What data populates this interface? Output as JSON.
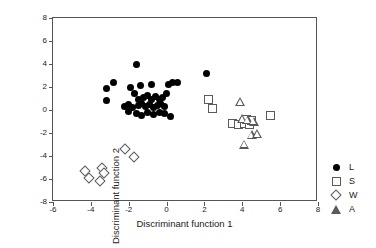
{
  "chart_data": {
    "type": "scatter",
    "title": "",
    "xlabel": "Discriminant function 1",
    "ylabel": "Discriminant function 2",
    "xlim": [
      -6,
      8
    ],
    "ylim": [
      -8,
      8
    ],
    "xticks": [
      -6,
      -4,
      -2,
      0,
      2,
      4,
      6,
      8
    ],
    "xtick_labels": [
      "-6",
      "-4",
      "-2",
      "0",
      "2",
      "4",
      "6",
      "8"
    ],
    "yticks": [
      -8,
      -6,
      -4,
      -2,
      0,
      2,
      4,
      6,
      8
    ],
    "ytick_labels": [
      "-8",
      "-6",
      "-4",
      "-2",
      "0",
      "2",
      "4",
      "6",
      "8"
    ],
    "grid": false,
    "legend_position": "right-outside",
    "series": [
      {
        "name": "L",
        "marker": "filled-circle",
        "color": "#000000",
        "points": [
          [
            -1.6,
            4.0
          ],
          [
            2.1,
            3.2
          ],
          [
            -3.2,
            1.9
          ],
          [
            -2.8,
            2.4
          ],
          [
            -1.9,
            2.0
          ],
          [
            -1.4,
            2.1
          ],
          [
            -0.8,
            2.2
          ],
          [
            0.1,
            2.2
          ],
          [
            0.3,
            2.4
          ],
          [
            0.6,
            2.4
          ],
          [
            -3.2,
            0.8
          ],
          [
            -1.7,
            1.4
          ],
          [
            -1.5,
            0.9
          ],
          [
            -1.2,
            1.1
          ],
          [
            -1.0,
            1.3
          ],
          [
            -0.8,
            0.9
          ],
          [
            -0.6,
            1.2
          ],
          [
            -0.4,
            0.9
          ],
          [
            -0.2,
            1.1
          ],
          [
            0.0,
            1.4
          ],
          [
            -2.2,
            0.3
          ],
          [
            -2.0,
            0.5
          ],
          [
            -1.8,
            0.2
          ],
          [
            -1.5,
            0.4
          ],
          [
            -1.3,
            0.6
          ],
          [
            -1.1,
            0.3
          ],
          [
            -0.9,
            0.5
          ],
          [
            -0.7,
            0.2
          ],
          [
            -0.5,
            0.4
          ],
          [
            -0.3,
            0.6
          ],
          [
            -0.1,
            0.3
          ],
          [
            -2.0,
            -0.1
          ],
          [
            -1.6,
            -0.3
          ],
          [
            -1.3,
            -0.5
          ],
          [
            -1.0,
            -0.2
          ],
          [
            -0.7,
            -0.4
          ],
          [
            -0.4,
            -0.2
          ],
          [
            -0.1,
            -0.3
          ],
          [
            0.2,
            -0.6
          ]
        ]
      },
      {
        "name": "S",
        "marker": "open-square",
        "color": "#5a5a5a",
        "points": [
          [
            2.2,
            0.9
          ],
          [
            2.4,
            0.1
          ],
          [
            3.5,
            -1.2
          ],
          [
            3.8,
            -1.3
          ],
          [
            4.1,
            -1.2
          ],
          [
            4.4,
            -1.3
          ],
          [
            4.2,
            -0.8
          ],
          [
            4.5,
            -0.9
          ],
          [
            5.5,
            -0.5
          ]
        ]
      },
      {
        "name": "W",
        "marker": "open-diamond",
        "color": "#5a5a5a",
        "points": [
          [
            -4.3,
            -5.3
          ],
          [
            -4.1,
            -5.9
          ],
          [
            -3.5,
            -6.2
          ],
          [
            -3.4,
            -5.0
          ],
          [
            -3.3,
            -5.5
          ],
          [
            -2.2,
            -3.4
          ],
          [
            -1.7,
            -4.1
          ]
        ]
      },
      {
        "name": "A",
        "marker": "open-triangle",
        "color": "#5a5a5a",
        "points": [
          [
            3.9,
            0.7
          ],
          [
            4.0,
            -0.8
          ],
          [
            4.3,
            -0.9
          ],
          [
            4.6,
            -1.0
          ],
          [
            4.5,
            -2.2
          ],
          [
            4.8,
            -2.1
          ],
          [
            4.1,
            -3.0
          ]
        ]
      }
    ]
  },
  "legend": {
    "entries": [
      {
        "label": "L",
        "marker": "filled-circle"
      },
      {
        "label": "S",
        "marker": "open-square"
      },
      {
        "label": "W",
        "marker": "open-diamond"
      },
      {
        "label": "A",
        "marker": "open-triangle"
      }
    ]
  }
}
